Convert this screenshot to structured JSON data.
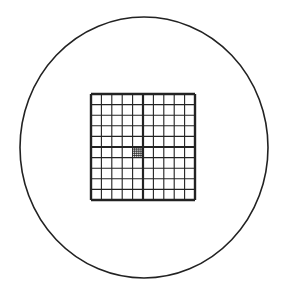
{
  "diagram": {
    "field_of_view": {
      "cx": 144,
      "cy": 147.5,
      "rx": 124,
      "ry": 130.5,
      "stroke": "#222222"
    },
    "grid": {
      "x": 91,
      "y": 94,
      "width": 104,
      "height": 106,
      "rows": 10,
      "cols": 10,
      "line_color": "#222222",
      "center_cross": true
    },
    "fine_grid": {
      "cell_col": 4,
      "cell_row": 5,
      "subdivisions": 5
    }
  }
}
